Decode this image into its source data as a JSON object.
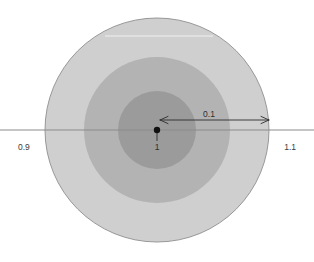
{
  "figure": {
    "type": "concentric-circles-diagram",
    "background_color": "#ffffff",
    "center_point": {
      "x": 157,
      "y": 130,
      "label": "1",
      "dot_color": "#111111",
      "dot_radius": 3.2
    },
    "axis": {
      "orientation": "horizontal",
      "y": 130,
      "x_start": 0,
      "x_end": 314,
      "color": "#8c8c8c",
      "stroke_width": 1.1,
      "left_label": "0.9",
      "right_label": "1.1"
    },
    "rings": [
      {
        "name": "outer-ring",
        "radius": 112,
        "fill": "#cfcfcf",
        "stroke": "#8f8f8f",
        "stroke_width": 0.9
      },
      {
        "name": "middle-ring",
        "radius": 73,
        "fill": "#b3b3b3",
        "stroke": "none",
        "stroke_width": 0
      },
      {
        "name": "inner-ring",
        "radius": 39,
        "fill": "#9b9b9b",
        "stroke": "none",
        "stroke_width": 0
      }
    ],
    "measure_arrow": {
      "label": "0.1",
      "y": 120,
      "x_start": 160,
      "x_end": 269,
      "color": "#2e2e2e",
      "stroke_width": 0.9,
      "double_headed": true,
      "label_x": 209,
      "label_y": 117
    },
    "artifact_line": {
      "name": "highlight-streak",
      "y": 36,
      "x_start": 105,
      "x_end": 213,
      "color": "#f2f2f2",
      "stroke_width": 1.2
    }
  },
  "chart_data": {
    "type": "scatter",
    "title": "",
    "xlabel": "",
    "ylabel": "",
    "center_value": 1,
    "axis_tick_labels": [
      "0.9",
      "1.1"
    ],
    "axis_range": [
      0.9,
      1.1
    ],
    "radius_label": "0.1",
    "bands": [
      {
        "label": "inner",
        "radius_value": 0.035,
        "fill": "#9b9b9b"
      },
      {
        "label": "middle",
        "radius_value": 0.065,
        "fill": "#b3b3b3"
      },
      {
        "label": "outer",
        "radius_value": 0.1,
        "fill": "#cfcfcf"
      }
    ],
    "grid": false,
    "legend": "none"
  }
}
